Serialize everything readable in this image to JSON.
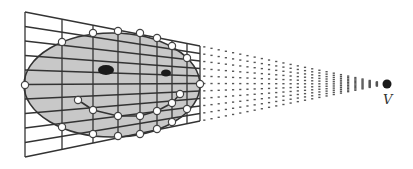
{
  "diagram": {
    "title": "",
    "viewpoint_label": "V",
    "colors": {
      "background": "#ffffff",
      "grid": "#333333",
      "face_fill": "#c8c8c8",
      "face_outline": "#333333",
      "eye": "#1a1a1a",
      "point_fill": "#ffffff",
      "point_stroke": "#444444",
      "rays": "#555555",
      "viewpoint": "#1a1a1a"
    },
    "grid": {
      "left_x": 25,
      "left_top_y": 12,
      "left_bottom_y": 157,
      "right_x": 200,
      "right_top_y": 46,
      "right_bottom_y": 121,
      "vertical_xs": [
        25,
        62,
        93,
        118,
        140,
        157,
        172,
        187,
        200
      ],
      "horizontal_rows": 10
    },
    "face": {
      "cx": 112,
      "cy": 85,
      "rx": 88,
      "ry": 52,
      "eyes": [
        {
          "cx": 106,
          "cy": 70,
          "rx": 8,
          "ry": 5
        },
        {
          "cx": 166,
          "cy": 73,
          "rx": 5,
          "ry": 3.5
        }
      ],
      "outline_points": [
        [
          25,
          85
        ],
        [
          62,
          42
        ],
        [
          93,
          33
        ],
        [
          118,
          31
        ],
        [
          140,
          33
        ],
        [
          157,
          38
        ],
        [
          172,
          46
        ],
        [
          187,
          58
        ],
        [
          200,
          84
        ],
        [
          187,
          109
        ],
        [
          172,
          122
        ],
        [
          157,
          129
        ],
        [
          140,
          134
        ],
        [
          118,
          136
        ],
        [
          93,
          134
        ],
        [
          62,
          127
        ]
      ],
      "mouth_points": [
        [
          78,
          100
        ],
        [
          93,
          110
        ],
        [
          118,
          116
        ],
        [
          140,
          116
        ],
        [
          157,
          111
        ],
        [
          172,
          103
        ],
        [
          180,
          94
        ]
      ]
    },
    "viewpoint": {
      "x": 387,
      "y": 84,
      "r": 4.5,
      "label_x": 383,
      "label_y": 92
    }
  }
}
